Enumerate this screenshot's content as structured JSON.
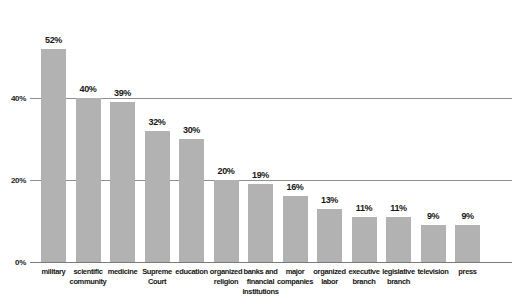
{
  "chart_data": {
    "type": "bar",
    "title": "",
    "subtitle": "",
    "xlabel": "",
    "ylabel": "",
    "ylim": [
      0,
      60
    ],
    "grid": true,
    "gridlines_at": [
      20,
      40
    ],
    "legend": "none",
    "y_ticks": [
      "0%",
      "20%",
      "40%"
    ],
    "y_tick_values": [
      0,
      20,
      40
    ],
    "categories": [
      "military",
      "scientific community",
      "medicine",
      "Supreme Court",
      "education",
      "organized religion",
      "banks and financial institutions",
      "major companies",
      "organized labor",
      "executive branch",
      "legislative branch",
      "television",
      "press"
    ],
    "values": [
      52,
      40,
      39,
      32,
      30,
      20,
      19,
      16,
      13,
      11,
      11,
      9,
      9
    ],
    "data_labels": [
      "52%",
      "40%",
      "39%",
      "32%",
      "30%",
      "20%",
      "19%",
      "16%",
      "13%",
      "11%",
      "11%",
      "9%",
      "9%"
    ],
    "bar_color": "#b2b2b2",
    "gridline_color": "#8f8f8f",
    "text_color": "#141414"
  }
}
